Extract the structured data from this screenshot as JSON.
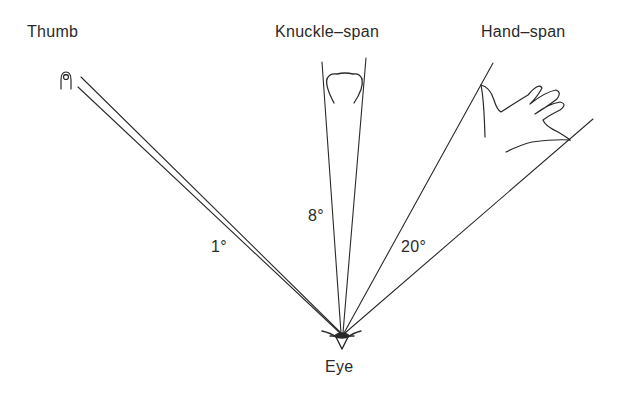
{
  "diagram": {
    "labels": {
      "thumb": "Thumb",
      "knuckle_span": "Knuckle–span",
      "hand_span": "Hand–span",
      "eye": "Eye"
    },
    "angles": {
      "thumb": "1°",
      "knuckle_span": "8°",
      "hand_span": "20°"
    },
    "colors": {
      "line": "#2a2a2a",
      "background": "#ffffff"
    }
  }
}
